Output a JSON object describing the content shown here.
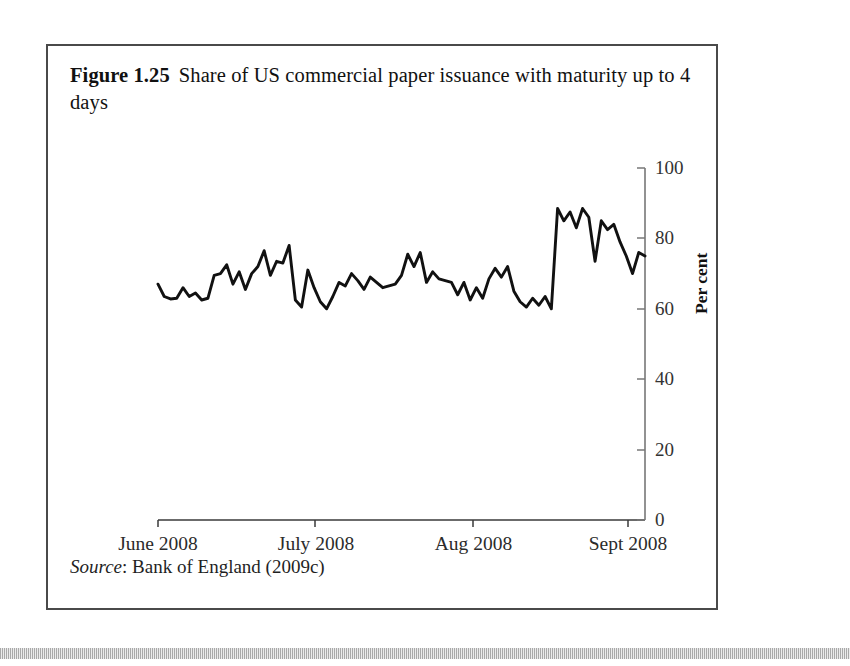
{
  "figure": {
    "label": "Figure 1.25",
    "title": "Share of US commercial paper issuance with maturity up to 4 days",
    "source_word": "Source",
    "source_text": ": Bank of England (2009c)"
  },
  "chart_data": {
    "type": "line",
    "title": "Share of US commercial paper issuance with maturity up to 4 days",
    "xlabel": "",
    "ylabel": "Per cent",
    "ylim": [
      0,
      100
    ],
    "yticks": [
      0,
      20,
      40,
      60,
      80,
      100
    ],
    "ytick_labels": [
      "0",
      "20",
      "40",
      "60",
      "80",
      "100"
    ],
    "y_axis_position": "right",
    "grid": false,
    "legend": false,
    "xtick_labels": [
      "June 2008",
      "July 2008",
      "Aug 2008",
      "Sept 2008"
    ],
    "xtick_positions": [
      0,
      22,
      44,
      66
    ],
    "xlim": [
      0,
      68
    ],
    "series": [
      {
        "name": "Share of US commercial paper issuance with maturity up to 4 days",
        "color": "#111111",
        "x": [
          0,
          1,
          2,
          3,
          4,
          5,
          6,
          7,
          8,
          9,
          10,
          11,
          12,
          13,
          14,
          15,
          16,
          17,
          18,
          19,
          20,
          21,
          22,
          23,
          24,
          25,
          26,
          27,
          28,
          29,
          30,
          31,
          32,
          33,
          34,
          35,
          36,
          37,
          38,
          39,
          40,
          41,
          42,
          43,
          44,
          45,
          46,
          47,
          48,
          49,
          50,
          51,
          52,
          53,
          54,
          55,
          56,
          57,
          58,
          59,
          60,
          61,
          62,
          63,
          64,
          65,
          66,
          67
        ],
        "values": [
          67.0,
          63.5,
          62.8,
          63.0,
          66.0,
          63.5,
          64.5,
          62.5,
          63.0,
          69.5,
          70.0,
          72.5,
          67.0,
          70.5,
          65.5,
          70.0,
          72.0,
          76.5,
          69.5,
          73.5,
          73.0,
          78.0,
          62.5,
          60.5,
          71.0,
          66.0,
          62.0,
          60.0,
          63.5,
          67.5,
          66.5,
          70.0,
          68.0,
          65.5,
          69.0,
          67.5,
          66.0,
          66.5,
          67.0,
          69.5,
          75.5,
          72.0,
          76.0,
          67.5,
          70.5,
          68.5,
          68.0,
          67.5,
          64.0,
          67.5,
          62.5,
          66.0,
          63.0,
          68.5,
          71.5,
          69.0,
          72.0,
          65.0,
          62.0,
          60.5,
          63.0,
          61.0,
          63.5,
          60.0,
          88.5,
          85.0,
          87.5,
          83.0
        ]
      }
    ],
    "series_tail": {
      "note": "continuation of same single series to the right axis",
      "values_extra": [
        88.5,
        86.0,
        73.5,
        85.0,
        82.5,
        84.0,
        79.0,
        75.0,
        70.0,
        76.0,
        75.0
      ]
    },
    "annotations": []
  },
  "axis": {
    "y_title": "Per cent"
  }
}
